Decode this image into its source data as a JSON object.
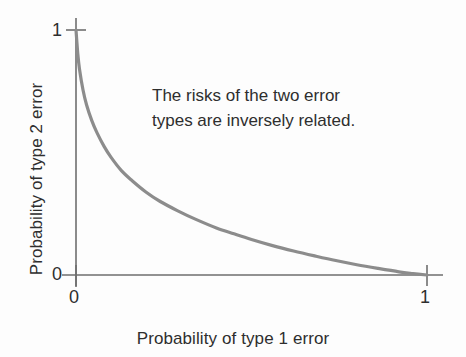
{
  "chart_data": {
    "type": "line",
    "title": "",
    "xlabel": "Probability of type 1 error",
    "ylabel": "Probability of type 2 error",
    "xlim": [
      0,
      1
    ],
    "ylim": [
      0,
      1
    ],
    "grid": false,
    "legend": null,
    "xticks": [
      "0",
      "1"
    ],
    "yticks": [
      "0",
      "1"
    ],
    "xtick_values": [
      0,
      1
    ],
    "ytick_values": [
      0,
      1
    ],
    "annotations": [
      {
        "name": "inverse-relation-note",
        "line1": "The risks of the two error",
        "line2": "types are inversely related.",
        "x": 0.28,
        "y": 0.78
      }
    ],
    "series": [
      {
        "name": "type-2-error-vs-type-1-error",
        "color": "#8c8c8c",
        "x": [
          0.0,
          0.005,
          0.01,
          0.02,
          0.03,
          0.045,
          0.06,
          0.08,
          0.1,
          0.13,
          0.16,
          0.2,
          0.24,
          0.29,
          0.34,
          0.4,
          0.45,
          0.5,
          0.56,
          0.62,
          0.68,
          0.74,
          0.8,
          0.86,
          0.92,
          0.96,
          1.0
        ],
        "y": [
          1.0,
          0.905,
          0.84,
          0.755,
          0.695,
          0.63,
          0.58,
          0.525,
          0.48,
          0.425,
          0.385,
          0.338,
          0.3,
          0.262,
          0.228,
          0.192,
          0.168,
          0.145,
          0.12,
          0.098,
          0.078,
          0.059,
          0.042,
          0.027,
          0.013,
          0.006,
          0.0
        ]
      }
    ]
  },
  "axes": {
    "x_title": "Probability of type 1 error",
    "y_title": "Probability of type 2 error",
    "y_tick_top": "1",
    "y_tick_bottom": "0",
    "x_tick_left": "0",
    "x_tick_right": "1"
  },
  "colors": {
    "curve": "#8c8c8c",
    "axis": "#6e6e6e",
    "text": "#2e2e2e",
    "background": "#fdfdfd"
  }
}
